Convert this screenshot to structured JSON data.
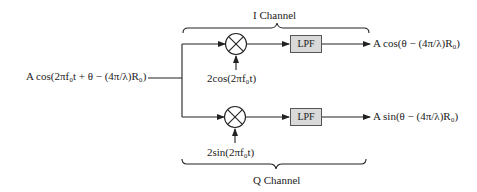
{
  "diagram": {
    "type": "IQ demodulator block diagram",
    "input_signal": "A cos(2πf₀t + θ − (4π/λ)R₀)",
    "i_channel": {
      "label": "I Channel",
      "oscillator": "2cos(2πf₀t)",
      "filter": "LPF",
      "output": "A cos(θ − (4π/λ)R₀)"
    },
    "q_channel": {
      "label": "Q Channel",
      "oscillator": "2sin(2πf₀t)",
      "filter": "LPF",
      "output": "A sin(θ − (4π/λ)R₀)"
    },
    "mixer_symbol": "⊗"
  }
}
